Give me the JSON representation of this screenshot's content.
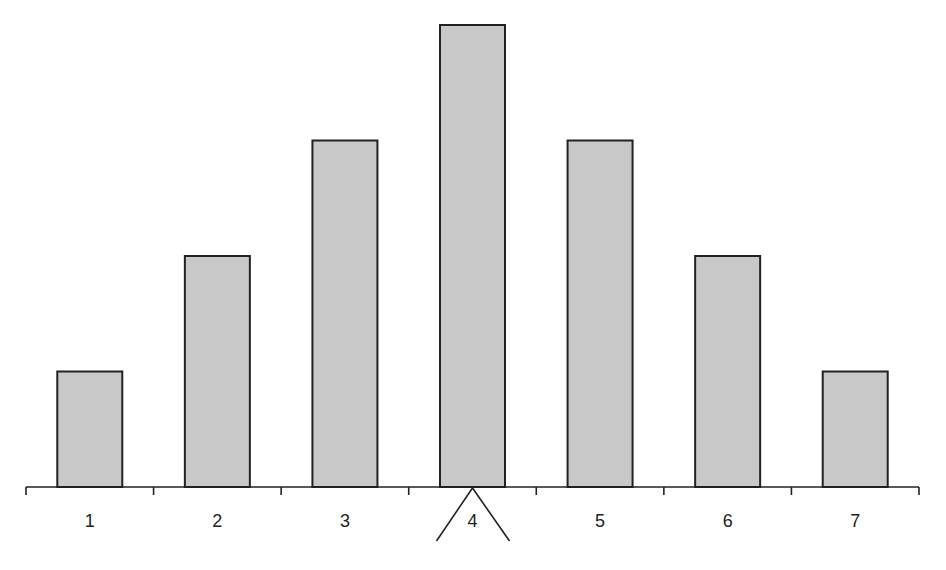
{
  "chart_data": {
    "type": "bar",
    "title": "",
    "xlabel": "",
    "ylabel": "",
    "categories": [
      "1",
      "2",
      "3",
      "4",
      "5",
      "6",
      "7"
    ],
    "values": [
      1,
      2,
      3,
      4,
      3,
      2,
      1
    ],
    "ylim": [
      0,
      4
    ],
    "grid": false,
    "legend": null,
    "y_axis_visible": false,
    "annotations": [
      {
        "type": "fulcrum",
        "description": "triangle balance point under category 4 (the mean/center)",
        "at_category": "4"
      }
    ]
  },
  "style": {
    "bar_fill": "#c8c8c8",
    "bar_stroke": "#222222",
    "axis_color": "#222222",
    "background": "#ffffff"
  },
  "layout": {
    "axis_y": 487,
    "axis_x_start": 26,
    "axis_x_end": 919,
    "bin_width": 127.6,
    "bar_width": 65,
    "unit_px": 115.5,
    "label_y": 527
  }
}
